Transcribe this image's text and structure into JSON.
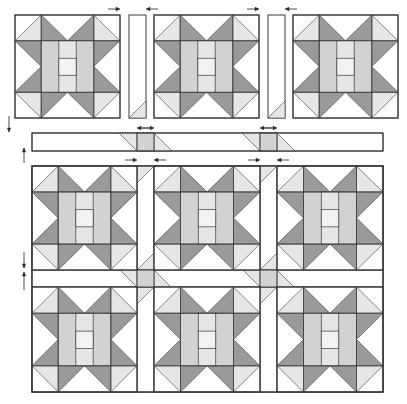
{
  "diagram": {
    "title": "Quilt assembly diagram",
    "colors": {
      "background": "#ffffff",
      "outline": "#3a3a3a",
      "dark": "#9a9a9a",
      "medium": "#d2d2d2",
      "light": "#e6e6e6",
      "white": "#ffffff",
      "center": "#f2f2f2"
    },
    "block_count": 9,
    "top_row": {
      "blocks": [
        {
          "x": 15,
          "y": 15,
          "size": 105
        },
        {
          "x": 154,
          "y": 15,
          "size": 105
        },
        {
          "x": 293,
          "y": 15,
          "size": 105
        }
      ],
      "vertical_sashing": [
        {
          "x": 129,
          "y": 15,
          "w": 17,
          "h": 103
        },
        {
          "x": 268,
          "y": 15,
          "w": 17,
          "h": 103
        }
      ],
      "press_arrows": [
        {
          "x": 120,
          "y": 9,
          "dir": "right"
        },
        {
          "x": 146,
          "y": 9,
          "dir": "left"
        },
        {
          "x": 259,
          "y": 9,
          "dir": "right"
        },
        {
          "x": 285,
          "y": 9,
          "dir": "left"
        }
      ]
    },
    "sashing_row": {
      "x": 32,
      "y": 133,
      "w": 351,
      "h": 18,
      "cornerstones": [
        {
          "x": 137,
          "w": 17
        },
        {
          "x": 260,
          "w": 17
        }
      ],
      "press_arrows": [
        {
          "x": 137,
          "y": 128,
          "dir": "left"
        },
        {
          "x": 154,
          "y": 128,
          "dir": "right"
        },
        {
          "x": 260,
          "y": 128,
          "dir": "left"
        },
        {
          "x": 277,
          "y": 128,
          "dir": "right"
        }
      ]
    },
    "assembled_top": {
      "x": 32,
      "y": 166,
      "w": 351,
      "h": 226,
      "columns": [
        {
          "x": 32,
          "w": 105
        },
        {
          "x": 154,
          "w": 106
        },
        {
          "x": 277,
          "w": 106
        }
      ],
      "rows": [
        {
          "y": 166,
          "h": 104
        },
        {
          "y": 287,
          "h": 105
        }
      ],
      "vertical_sashing": [
        {
          "x": 137,
          "w": 17
        },
        {
          "x": 260,
          "w": 17
        }
      ],
      "horizontal_sashing": {
        "y": 270,
        "h": 17
      },
      "press_arrows": [
        {
          "x": 137,
          "y": 160,
          "dir": "right"
        },
        {
          "x": 154,
          "y": 160,
          "dir": "left"
        },
        {
          "x": 260,
          "y": 160,
          "dir": "right"
        },
        {
          "x": 277,
          "y": 160,
          "dir": "left"
        }
      ]
    },
    "side_arrows": [
      {
        "x": 9,
        "y1": 116,
        "y2": 132,
        "dir": "down"
      },
      {
        "x": 24,
        "y1": 148,
        "y2": 163,
        "dir": "up"
      },
      {
        "x": 24,
        "y1": 252,
        "y2": 268,
        "dir": "down"
      },
      {
        "x": 24,
        "y1": 272,
        "y2": 290,
        "dir": "up"
      }
    ]
  }
}
